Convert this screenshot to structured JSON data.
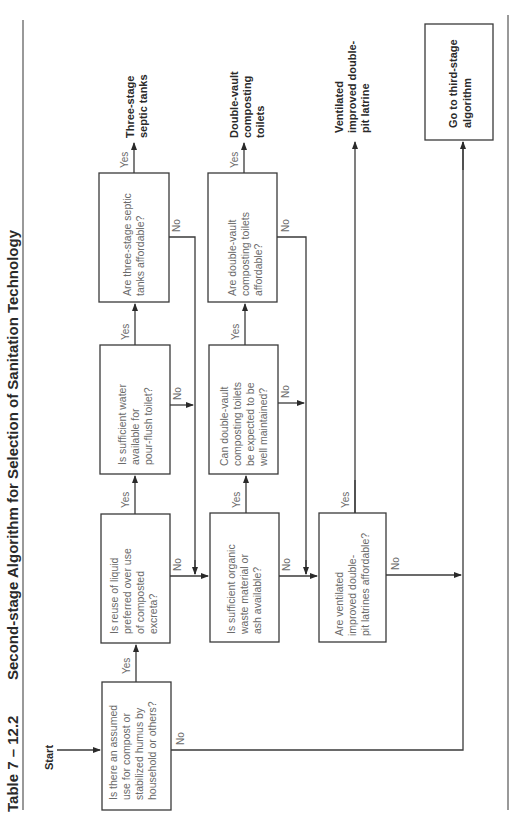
{
  "header": {
    "table_number": "Table 7 – 12.2",
    "title": "Second-stage Algorithm for Selection of Sanitation Technology"
  },
  "start_label": "Start",
  "decisions": [
    {
      "id": "assumed-use",
      "lines": [
        "Is there an assumed",
        "use for compost or",
        "stabilized humus by",
        "household or others?"
      ]
    },
    {
      "id": "reuse-liquid",
      "lines": [
        "Is reuse of liquid",
        "preferred over use",
        "of composted",
        "excreta?"
      ]
    },
    {
      "id": "sufficient-water",
      "lines": [
        "Is sufficient water",
        "available for",
        "pour-flush toilet?"
      ]
    },
    {
      "id": "septic-affordable",
      "lines": [
        "Are three-stage septic",
        "tanks affordable?"
      ]
    },
    {
      "id": "organic-waste",
      "lines": [
        "Is sufficient organic",
        "waste material or",
        "ash available?"
      ]
    },
    {
      "id": "dv-maintained",
      "lines": [
        "Can double-vault",
        "composting toilets",
        "be expected to be",
        "well maintained?"
      ]
    },
    {
      "id": "dv-affordable",
      "lines": [
        "Are double-vault",
        "composting toilets",
        "affordable?"
      ]
    },
    {
      "id": "vip-affordable",
      "lines": [
        "Are ventilated",
        "improved double-",
        "pit latrines affordable?"
      ]
    }
  ],
  "outcomes": [
    {
      "id": "septic-tanks",
      "lines": [
        "Three-stage",
        "septic tanks"
      ]
    },
    {
      "id": "double-vault-toilets",
      "lines": [
        "Double-vault",
        "composting",
        "toilets"
      ]
    },
    {
      "id": "vip-latrine",
      "lines": [
        "Ventilated",
        "improved double-",
        "pit latrine"
      ]
    },
    {
      "id": "third-stage",
      "lines": [
        "Go to third-stage",
        "algorithm"
      ]
    }
  ],
  "edge_labels": {
    "yes": "Yes",
    "no": "No"
  }
}
